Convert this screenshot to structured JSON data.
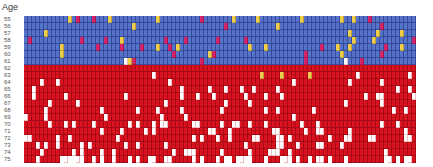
{
  "chart_data": {
    "type": "heatmap",
    "title": "",
    "ylabel": "Age",
    "xlabel": "",
    "y_ticks": [
      "55",
      "56",
      "57",
      "58",
      "59",
      "60",
      "61",
      "62",
      "63",
      "64",
      "65",
      "66",
      "67",
      "68",
      "69",
      "70",
      "71",
      "72",
      "73",
      "74",
      "75"
    ],
    "columns": 98,
    "legend": {
      "B": "blue cell (ages 55-61 baseline)",
      "R": "red cell (ages 62-75 baseline)",
      "Y": "yellow cell",
      "M": "magenta cell",
      "W": "white cell",
      "N": "empty"
    },
    "colors": {
      "B": "#5574c9",
      "R": "#d9121f",
      "Y": "#f0cf4c",
      "M": "#d62468",
      "W": "#ffffff"
    },
    "rows": [
      "BBBBBBBBBBBYBMBBBMBBBYBBBBBBBBBBBYBBBBBBBBBBMBBBBBBBYBBBBBYBBBBBBBBBBYBBBBBBBBBYBBYBBBMBBBBBBBBBBB",
      "BBBBBBBBBBBBBBBBBBBBBBBBBBBYBBBBBBBBBBBBBBBBBBBBBBMBBBBBBBBBBBBYBBBBBBBBBBBBBBBBBBBBBBBBBMBBBBBBBB",
      "BBBBBYBBBBBBBBBBBBBBBBBBBBBBBBBBBBBBBBBBBBBBBBBBBBBBBBBBBBBBBBBBBBBBBBBBBBBBBBBBBYBBBBBBYBBBBBYBBB",
      "BMBBBBBBBBBBBBMBBBBBMBBBYBBBBBBBBBBMBBBBMBBBBBBBMBBBBBBMBBBBBBBBBBBBBBBBBBBBBBBBBBYBBBBYBBBBBBBBBM",
      "BBBBBBBBBYBBBBBBBBMBBBBBMBBBBMBBBYBBMBYBBBBBBBBBBBBBBBBBYBBBYBBBBBBBBBBBBBMBBBYBBYBBBBBBBBMBBBYBBBM",
      "BBBBBBBBBYBBBBBBBBBBBBBBBBBBBBBBBBBBBMBBBBBBBBYMBBBBBBBBBBBBBBBBBBBBBBMBBBBBBBBYBBBBBBBBBMBBBBBBBB",
      "BBBBBBBBBBBBBBBBBBBBBBBBBWYMBBBBBBBBBBBBBBBBMBBBBBBBBBBBBBBBBBBBBBBBBBMBBBBBBBBBWBBBMBBBBBBBBBBBBB",
      "RRRRRRRRRRRRRRRRRRRRRRRRRRRRRRRRRRRRRRRRRRRRRRRRRRRRRRRRRRRRRRRRRRRRRRRRRRRRRRRRRRRRRRRRRRRRRRRRRR",
      "RRRRRRRRRRRRRRRRRRRRRRRRRRRRRRRRRRRRRRRRRRRRRRRRRRRRRRRRRRRYRRRRYRRRRRRYRRRRRRRRRRRWRRRRRRRRRRRRWRR",
      "RRRRRRRRWRRRRRRRRRRRRRRRRRRRRRRRRRRRRRRRRRRRRRRRRRRRRRRRRRRRRRRRRRRWRRRRRRRRRRRRRRRRRRRRRWRRRRRRRRRR",
      "RRRRRRRRRRRRRRRRRRRRRRRRRRRRRRRRRRRRRRRRRRRRRRRRRRRRRRWRRRRRRRRRRRRRRRRRRRRRRRRRRRRRRRRRRRRRRRRRRRRR",
      "RRRRRRRRRRRRRRRRRRRRRRRRRRRRRRRRRRRRRRRRRRRRRRRWRRRRRRRRRRRRWRRRWRRRRRRRRRRRRRRRRRRRRRRRWRRRRRRRRWRR",
      "RRRRRRRRRRRRRRRRRRRRRRRRRRRRRRRRRRRWRRRRRRRRRRRRRRWRRRRRRRRRRRRRRRRRRRRRRRRRRRRRRRRRRRRRRRRRRRRRRRRR",
      "RRRRRWRRRRRRRRRRRRRWRRRRRRRRRRRRRRRRRRRWRRRRRRRRRRRRRRRRRRRRRRRWRRRRRRRRWRRRRRRRRRRRRRRRRRRRWRRRRRRR",
      "RRRRRRRRRRRRRRRRRRRRWRRRRRRRRRRRRRWRRRRRWRRRRRRRRRRRRRRRRRRRRRRRRRRWRRRRRRRRRRRRRRRRRRRRRRRRRRRRRRRR",
      "RRRRRRRRRRWRRRRRRRRRRRRRRRWRRRRRWRWWRRRRRRWWRRRRRWRRWRRRWRRRRRRRRRRRRWRRRRRRRRRRRRRRRRRRRRRRRWRRRRR",
      "RRRRRRRRRRRRRRRRRRRRRRRRRRRRRRRRRRRRRRRRRRRRRRWWRRRRRRRRRRRRRRRRRRRRRRRRRWWRRRRRRRRRRRRRRRRRRRRWRRRR",
      "RRRRRRRRRRRWRRRRRRRRRRRRRRRRRRRRRRRRRRRRRRRRRRRRRRRWRRRRRWWRRRRWRRRRRRRRRRRRRRRRRRRRRRWWRRRRRRRWRRRR",
      "RRRRRRRRRRRRRRRRRRRRRRRRRRRRRRRRRRRRRRRRRRRRRRRRRRRRRRRRRRRRRRRRRRRRRRRRRRRRRRRRRRRRRRRRRRRRRRRRRRRR",
      "RRRRRRRRRRRRRRRRRRRRRRRRRRRRRRRRRRRRRRRRRRRRRRRRRRRRRRRRRRRRRRRRRRRRRRRRRRRRRRRRRRRRRRRRRRRRRRRRRRRR",
      "RRRRRRRRRRRRRRRRRRRRRRRRRRRRRRRRRRRRRRRRRRRRRRRRRRRRRRRRRRRRRRRRRRRRRRRRRRRRRRRRRRRRRRRRRRRRRRRRRRRR"
    ]
  }
}
